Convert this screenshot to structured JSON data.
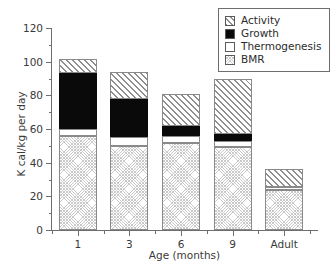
{
  "chart_data": {
    "type": "bar",
    "stacked": true,
    "title": "",
    "xlabel": "Age (months)",
    "ylabel": "K cal/kg per day",
    "categories": [
      "1",
      "3",
      "6",
      "9",
      "Adult"
    ],
    "ylim": [
      0,
      120
    ],
    "ytick_major": [
      0,
      20,
      40,
      60,
      80,
      100,
      120
    ],
    "ytick_minor": [
      10,
      30,
      50,
      70,
      90,
      110
    ],
    "grid": false,
    "legend_position": "top-right",
    "series": [
      {
        "name": "BMR",
        "pattern": "fine-crosshatch",
        "values": [
          56,
          50,
          51.5,
          49.5,
          24
        ]
      },
      {
        "name": "Thermogenesis",
        "pattern": "white",
        "values": [
          4,
          5,
          4.5,
          3.5,
          1.5
        ]
      },
      {
        "name": "Growth",
        "pattern": "solid-black",
        "values": [
          33.5,
          23,
          5.5,
          4,
          0
        ]
      },
      {
        "name": "Activity",
        "pattern": "diagonal-hatch",
        "values": [
          8,
          16,
          19.5,
          33,
          11
        ]
      }
    ],
    "totals": [
      101.5,
      94,
      81,
      90,
      36.5
    ]
  },
  "legend": {
    "entries": [
      {
        "label": "Activity",
        "swatch": "diagonal-hatch"
      },
      {
        "label": "Growth",
        "swatch": "solid-black"
      },
      {
        "label": "Thermogenesis",
        "swatch": "white"
      },
      {
        "label": "BMR",
        "swatch": "fine-crosshatch"
      }
    ]
  },
  "colors": {
    "axis": "#6e6e6e",
    "text": "#3a3a3a",
    "growth": "#0a0a0a",
    "hatch": "#8f8f8f",
    "bmr_texture": "#c9c9c9",
    "background": "#ffffff"
  }
}
